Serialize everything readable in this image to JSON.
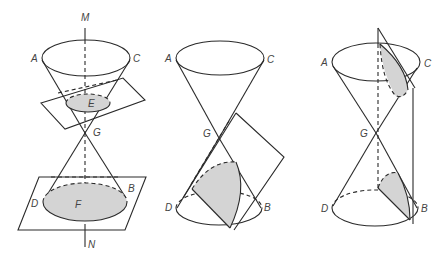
{
  "figure": {
    "colors": {
      "line": "#2a2a2a",
      "shade": "#d4d4d4",
      "label": "#444444",
      "background": "#ffffff"
    },
    "panels": [
      {
        "id": "circle",
        "labels": {
          "M": "M",
          "A": "A",
          "C": "C",
          "E": "E",
          "G": "G",
          "D": "D",
          "F": "F",
          "B": "B",
          "N": "N"
        }
      },
      {
        "id": "ellipse",
        "labels": {
          "A": "A",
          "C": "C",
          "G": "G",
          "D": "D",
          "B": "B"
        }
      },
      {
        "id": "hyperbola",
        "labels": {
          "A": "A",
          "C": "C",
          "G": "G",
          "D": "D",
          "B": "B"
        }
      }
    ]
  }
}
